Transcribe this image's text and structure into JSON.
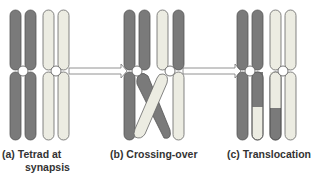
{
  "figure": {
    "panels": [
      {
        "id": "a",
        "label_line1": "(a) Tetrad at",
        "label_line2": "synapsis"
      },
      {
        "id": "b",
        "label_line1": "(b) Crossing-over"
      },
      {
        "id": "c",
        "label_line1": "(c) Translocation"
      }
    ],
    "colors": {
      "dark_chromatid": "#7a7a7a",
      "light_chromatid": "#ecece2",
      "outline": "#555555",
      "arrow_fill": "#ffffff"
    }
  }
}
